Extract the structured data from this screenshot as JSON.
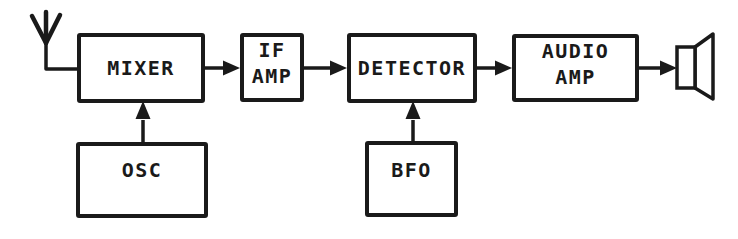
{
  "diagram": {
    "kind": "block-diagram",
    "colors": {
      "ink": "#1a1a1a",
      "background": "#ffffff"
    },
    "blocks": {
      "mixer": {
        "label": "MIXER"
      },
      "if_amp": {
        "lines": [
          "IF",
          "AMP"
        ]
      },
      "detector": {
        "label": "DETECTOR"
      },
      "audio_amp": {
        "lines": [
          "AUDIO",
          "AMP"
        ]
      },
      "osc": {
        "label": "OSC"
      },
      "bfo": {
        "label": "BFO"
      }
    },
    "icons": {
      "input": "antenna-icon",
      "output": "speaker-icon"
    },
    "connections": [
      {
        "from": "antenna",
        "to": "mixer",
        "arrowhead": false
      },
      {
        "from": "mixer",
        "to": "if_amp",
        "arrowhead": true
      },
      {
        "from": "if_amp",
        "to": "detector",
        "arrowhead": true
      },
      {
        "from": "detector",
        "to": "audio_amp",
        "arrowhead": true
      },
      {
        "from": "audio_amp",
        "to": "speaker",
        "arrowhead": true
      },
      {
        "from": "osc",
        "to": "mixer",
        "arrowhead": true
      },
      {
        "from": "bfo",
        "to": "detector",
        "arrowhead": true
      }
    ]
  }
}
